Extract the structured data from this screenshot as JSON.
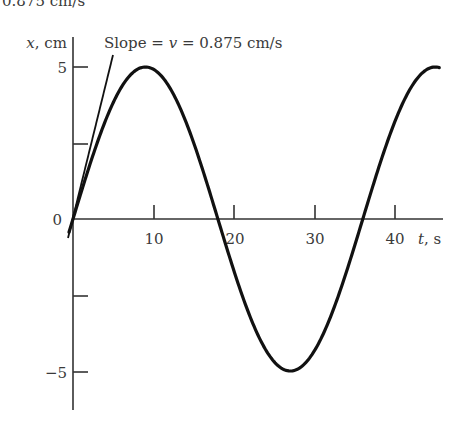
{
  "cutoff_text": "0.875 cm/s",
  "chart_data": {
    "type": "line",
    "title": "",
    "xlabel": "t, s",
    "ylabel": "x, cm",
    "x_ticks": [
      10,
      20,
      30,
      40
    ],
    "x_tick_labels": [
      "10",
      "20",
      "30",
      "40"
    ],
    "y_ticks": [
      -5,
      -2.5,
      0,
      2.5,
      5
    ],
    "y_tick_labels": [
      "−5",
      "",
      "0",
      "",
      "5"
    ],
    "xlim": [
      0,
      46
    ],
    "ylim": [
      -6.2,
      6.0
    ],
    "grid": false,
    "series": [
      {
        "name": "x(t) = 5 sin(2πt/36)",
        "amplitude": 5,
        "period": 36,
        "x": [
          0,
          4.5,
          9,
          13.5,
          18,
          22.5,
          27,
          31.5,
          36,
          40.5,
          45.5
        ],
        "y": [
          0,
          3.54,
          5,
          3.54,
          0,
          -3.54,
          -5,
          -3.54,
          0,
          3.54,
          5
        ]
      }
    ],
    "annotations": [
      {
        "text": "Slope = v = 0.875 cm/s",
        "target": "tangent line at t = 0"
      }
    ]
  },
  "labels": {
    "ylabel_x": "x",
    "ylabel_unit": ", cm",
    "xlabel_t": "t",
    "xlabel_unit": ", s",
    "y5": "5",
    "y0": "0",
    "yneg5": "−5",
    "x10": "10",
    "x20": "20",
    "x30": "30",
    "x40": "40",
    "slope_prefix": "Slope = ",
    "slope_v": "v",
    "slope_suffix": " = 0.875 cm/s"
  }
}
